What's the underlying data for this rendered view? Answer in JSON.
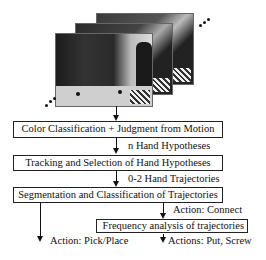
{
  "image_stack": {
    "description": "stack of video frames showing a person manipulating objects at a table",
    "frame_count_visible": 3
  },
  "boxes": [
    {
      "label": "Color Classification + Judgment from Motion"
    },
    {
      "label": "Tracking and Selection of Hand Hypotheses"
    },
    {
      "label": "Segmentation and Classification of Trajectories"
    },
    {
      "label": "Frequency analysis of trajectories"
    }
  ],
  "edge_labels": [
    {
      "label": "n Hand Hypotheses"
    },
    {
      "label": "0-2 Hand Trajectories"
    },
    {
      "label": "Action: Connect"
    },
    {
      "label": "Action: Pick/Place"
    },
    {
      "label": "Actions: Put, Screw"
    }
  ]
}
